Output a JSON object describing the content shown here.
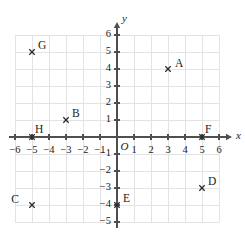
{
  "chart_data": {
    "type": "scatter",
    "title": "",
    "xlabel": "x",
    "ylabel": "y",
    "grid": true,
    "legend": "none",
    "origin_label": "O",
    "xlim": [
      -6,
      6
    ],
    "ylim": [
      -5,
      6
    ],
    "x_ticks": [
      -6,
      -5,
      -4,
      -3,
      -2,
      -1,
      1,
      2,
      3,
      4,
      5,
      6
    ],
    "y_ticks": [
      6,
      5,
      4,
      3,
      2,
      1,
      -1,
      -2,
      -3,
      -4,
      -5
    ],
    "x_tick_labels": [
      "−6",
      "−5",
      "−4",
      "−3",
      "−2",
      "−1",
      "1",
      "2",
      "3",
      "4",
      "5",
      "6"
    ],
    "y_tick_labels": [
      "6",
      "5",
      "4",
      "3",
      "2",
      "1",
      "−1",
      "−2",
      "−3",
      "−4",
      "−5"
    ],
    "grid_x_range": [
      -6,
      6
    ],
    "grid_y_range": [
      -5,
      6
    ],
    "points": [
      {
        "label": "A",
        "x": 3,
        "y": 4,
        "label_dx": 7,
        "label_dy": -5
      },
      {
        "label": "B",
        "x": -3,
        "y": 1,
        "label_dx": 6,
        "label_dy": -6
      },
      {
        "label": "C",
        "x": -5,
        "y": -4,
        "label_dx": -13,
        "label_dy": -5
      },
      {
        "label": "D",
        "x": 5,
        "y": -3,
        "label_dx": 6,
        "label_dy": -6
      },
      {
        "label": "E",
        "x": 0,
        "y": -4,
        "label_dx": 6,
        "label_dy": -6
      },
      {
        "label": "F",
        "x": 5,
        "y": 0,
        "label_dx": 3,
        "label_dy": -7
      },
      {
        "label": "G",
        "x": -5,
        "y": 5,
        "label_dx": 6,
        "label_dy": -6
      },
      {
        "label": "H",
        "x": -5,
        "y": 0,
        "label_dx": 3,
        "label_dy": -7
      }
    ],
    "colors": {
      "background": "#ffffff",
      "gridline": "#e3e3e3",
      "axis": "#4f4f4f",
      "text": "#1a1a1a",
      "marker": "#2b2b2b"
    }
  }
}
